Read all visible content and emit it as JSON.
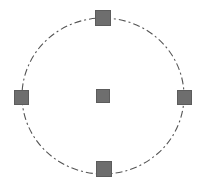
{
  "canvas": {
    "width": 207,
    "height": 191,
    "background_color": "#ffffff"
  },
  "diagram": {
    "type": "radial-node-layout",
    "title": "",
    "orbit": {
      "name": "dash-dot-circle",
      "center_x": 103,
      "center_y": 96,
      "radius_x": 81,
      "radius_y": 78,
      "stroke_color": "#555555",
      "stroke_width": 1,
      "dash_pattern": "7 3 2 3"
    },
    "nodes": [
      {
        "id": "node-center",
        "label": "",
        "position": "center",
        "center_x": 103,
        "center_y": 96,
        "size": 14,
        "fill_color": "#6e6e6e",
        "border_color": "#5c5c5c"
      },
      {
        "id": "node-top",
        "label": "",
        "position": "top",
        "center_x": 103,
        "center_y": 18,
        "size": 16,
        "fill_color": "#6e6e6e",
        "border_color": "#5c5c5c"
      },
      {
        "id": "node-right",
        "label": "",
        "position": "right",
        "center_x": 184,
        "center_y": 97,
        "size": 15,
        "fill_color": "#6e6e6e",
        "border_color": "#5c5c5c"
      },
      {
        "id": "node-bottom",
        "label": "",
        "position": "bottom",
        "center_x": 104,
        "center_y": 169,
        "size": 16,
        "fill_color": "#6e6e6e",
        "border_color": "#5c5c5c"
      },
      {
        "id": "node-left",
        "label": "",
        "position": "left",
        "center_x": 21,
        "center_y": 97,
        "size": 15,
        "fill_color": "#6e6e6e",
        "border_color": "#5c5c5c"
      }
    ]
  }
}
